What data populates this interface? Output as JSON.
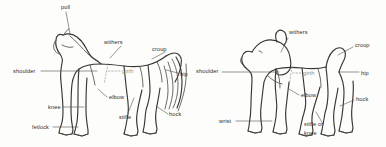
{
  "figure": {
    "background_color": "#fdfdfc",
    "line_color": "#3a3732",
    "label_color": "#2e2b27"
  },
  "horse": {
    "name": "horse-diagram",
    "labels": [
      {
        "key": "poll",
        "text": "poll",
        "x": 61,
        "y": 4
      },
      {
        "key": "withers",
        "text": "withers",
        "x": 104,
        "y": 39
      },
      {
        "key": "croup",
        "text": "croup",
        "x": 152,
        "y": 46
      },
      {
        "key": "shoulder",
        "text": "shoulder",
        "x": 13,
        "y": 68
      },
      {
        "key": "girth",
        "text": "girth",
        "x": 122,
        "y": 68
      },
      {
        "key": "hip",
        "text": "hip",
        "x": 180,
        "y": 71
      },
      {
        "key": "elbow",
        "text": "elbow",
        "x": 109,
        "y": 96
      },
      {
        "key": "knee",
        "text": "knee",
        "x": 48,
        "y": 104
      },
      {
        "key": "stifle",
        "text": "stifle",
        "x": 120,
        "y": 114
      },
      {
        "key": "hock",
        "text": "hock",
        "x": 170,
        "y": 112
      },
      {
        "key": "fetlock",
        "text": "fetlock",
        "x": 32,
        "y": 124
      }
    ]
  },
  "dog": {
    "name": "dog-diagram",
    "labels": [
      {
        "key": "withers",
        "text": "withers",
        "x": 290,
        "y": 31
      },
      {
        "key": "croup",
        "text": "croup",
        "x": 355,
        "y": 42
      },
      {
        "key": "shoulder",
        "text": "shoulder",
        "x": 196,
        "y": 69
      },
      {
        "key": "girth",
        "text": "girth",
        "x": 303,
        "y": 70
      },
      {
        "key": "hip",
        "text": "hip",
        "x": 361,
        "y": 70
      },
      {
        "key": "elbow",
        "text": "elbow",
        "x": 301,
        "y": 94
      },
      {
        "key": "hock",
        "text": "hock",
        "x": 356,
        "y": 98
      },
      {
        "key": "wrist",
        "text": "wrist",
        "x": 220,
        "y": 118
      },
      {
        "key": "stifle-or",
        "text": "stifle or",
        "x": 305,
        "y": 123
      },
      {
        "key": "stifle-knee",
        "text": "knee",
        "x": 305,
        "y": 131
      }
    ]
  }
}
